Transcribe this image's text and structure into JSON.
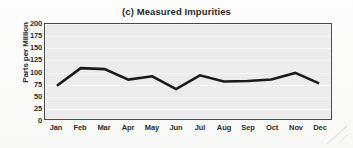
{
  "chart_data": {
    "type": "line",
    "title": "(c) Measured Impurities",
    "xlabel": "",
    "ylabel": "Parts per Million",
    "categories": [
      "Jan",
      "Feb",
      "Mar",
      "Apr",
      "May",
      "Jun",
      "Jul",
      "Aug",
      "Sep",
      "Oct",
      "Nov",
      "Dec"
    ],
    "values": [
      70,
      107,
      105,
      83,
      90,
      63,
      92,
      79,
      80,
      83,
      97,
      75
    ],
    "series": [
      {
        "name": "Measured Impurities",
        "values": [
          70,
          107,
          105,
          83,
          90,
          63,
          92,
          79,
          80,
          83,
          97,
          75
        ]
      }
    ],
    "ylim": [
      0,
      200
    ],
    "ytick_labels": [
      "0",
      "25",
      "50",
      "75",
      "100",
      "125",
      "150",
      "175",
      "200"
    ],
    "ytick_values": [
      0,
      25,
      50,
      75,
      100,
      125,
      150,
      175,
      200
    ],
    "grid": true,
    "grid_orientation": "horizontal",
    "legend": false,
    "legend_position": "none",
    "line_color": "#1a1a1a",
    "plot_background": "#ececec",
    "figure_background": "#fdfdfc",
    "axis_color": "#4a4a4a",
    "text_color": "#2d2d2d"
  }
}
